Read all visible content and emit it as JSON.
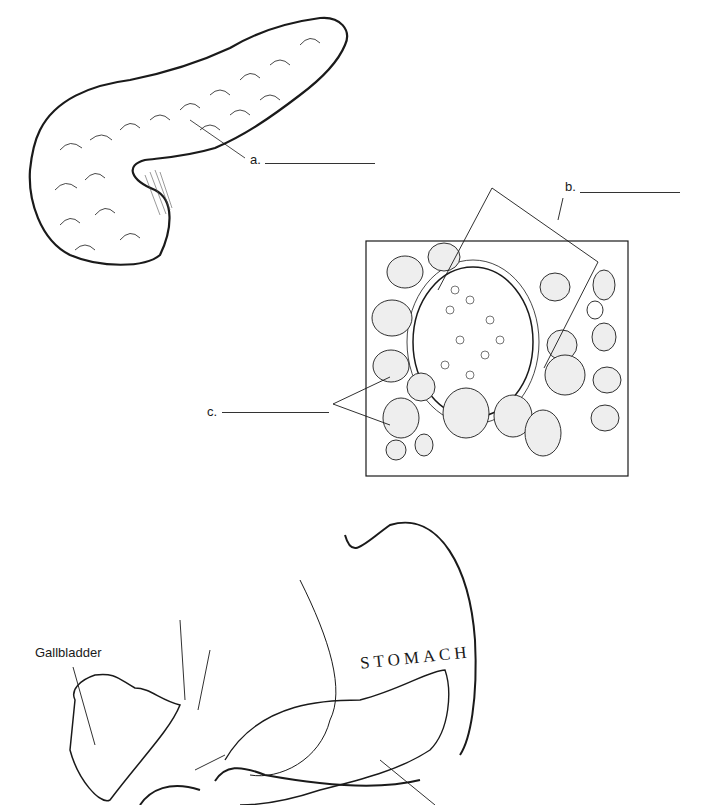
{
  "figure_a": {
    "subject": "pancreas",
    "label": "a.",
    "answer_blank": ""
  },
  "figure_b": {
    "subject": "pancreatic tissue micrograph",
    "labels": [
      {
        "id": "b",
        "text": "b.",
        "answer_blank": ""
      },
      {
        "id": "c",
        "text": "c.",
        "answer_blank": ""
      }
    ]
  },
  "figure_c": {
    "subject": "pancreas with surrounding organs",
    "organ_labels": [
      "Gallbladder",
      "STOMACH"
    ]
  },
  "colors": {
    "ink": "#1a1a1a",
    "stipple": "#888888",
    "background": "#ffffff"
  }
}
